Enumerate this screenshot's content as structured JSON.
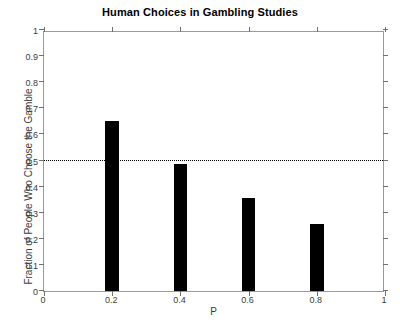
{
  "chart_data": {
    "type": "bar",
    "title": "Human Choices in Gambling Studies",
    "xlabel": "P",
    "ylabel": "Fraction of People Who Choose the Gamble",
    "categories": [
      "0.2",
      "0.4",
      "0.6",
      "0.8"
    ],
    "x": [
      0.2,
      0.4,
      0.6,
      0.8
    ],
    "values": [
      0.65,
      0.485,
      0.355,
      0.255
    ],
    "bar_width": 0.04,
    "bar_color": "#000000",
    "xlim": [
      0,
      1
    ],
    "ylim": [
      0,
      1
    ],
    "grid": false,
    "legend": null,
    "xticks": [
      "0",
      "0.2",
      "0.4",
      "0.6",
      "0.8",
      "1"
    ],
    "xtick_values": [
      0,
      0.2,
      0.4,
      0.6,
      0.8,
      1
    ],
    "yticks": [
      "0",
      "0.1",
      "0.2",
      "0.3",
      "0.4",
      "0.5",
      "0.6",
      "0.7",
      "0.8",
      "0.9",
      "1"
    ],
    "ytick_values": [
      0,
      0.1,
      0.2,
      0.3,
      0.4,
      0.5,
      0.6,
      0.7,
      0.8,
      0.9,
      1
    ],
    "annotations": [
      {
        "type": "horizontal-reference-line",
        "value": 0.5,
        "style": "dotted",
        "color": "#000000"
      }
    ],
    "axis_color": "#9a9a9a",
    "tick_color": "#6f6f6f",
    "text_color": "#3b3b3b"
  }
}
